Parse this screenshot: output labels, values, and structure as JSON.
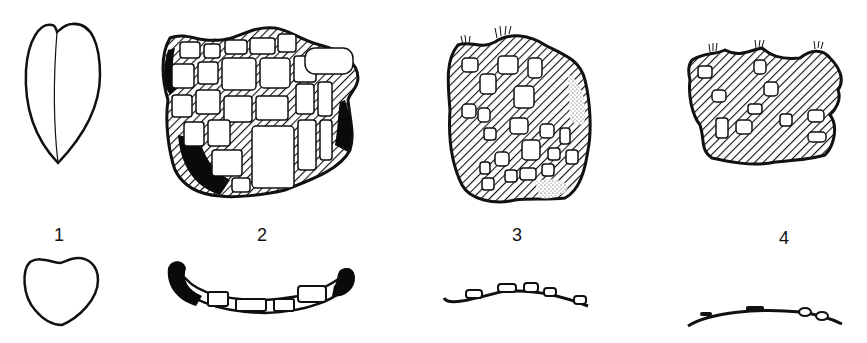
{
  "figure": {
    "panels": [
      {
        "id": 1,
        "label": "1",
        "top_view": "seed-outline-with-median-line",
        "section_view": "heart-shaped-cross-section"
      },
      {
        "id": 2,
        "label": "2",
        "top_view": "reticulate-cells-hatched-walls-dark-margins",
        "section_view": "concave-section-with-cells-dark-ends"
      },
      {
        "id": 3,
        "label": "3",
        "top_view": "hatched-fragment-with-white-inclusions-stippled-patches",
        "section_view": "thin-curved-section-with-small-cells"
      },
      {
        "id": 4,
        "label": "4",
        "top_view": "hatched-irregular-fragment-with-inclusions",
        "section_view": "thin-arc-with-few-bumps"
      }
    ],
    "colors": {
      "ink": "#111111",
      "background": "#ffffff",
      "dark_fill": "#0a0a0a"
    }
  }
}
